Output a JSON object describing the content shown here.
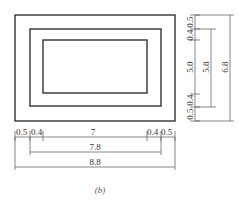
{
  "figure": {
    "caption": "(b)",
    "colors": {
      "line": "#333333",
      "dim": "#555555",
      "text": "#333333"
    }
  },
  "horizontal_dimensions": {
    "row1": {
      "left_outer": "0.5",
      "left_inner": "0.4",
      "center": "7",
      "right_inner": "0.4",
      "right_outer": "0.5"
    },
    "row2": {
      "label": "7.8"
    },
    "row3": {
      "label": "8.8"
    }
  },
  "vertical_dimensions": {
    "col1": {
      "top_outer": "0.5",
      "top_inner": "0.4",
      "center": "5.0",
      "bottom_inner": "0.4",
      "bottom_outer": "0.5"
    },
    "col2": {
      "label": "5.8"
    },
    "col3": {
      "label": "6.8"
    }
  }
}
